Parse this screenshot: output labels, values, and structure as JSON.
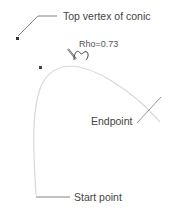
{
  "diagram": {
    "labels": {
      "top_vertex": "Top vertex of conic",
      "rho": "Rho=0.73",
      "endpoint": "Endpoint",
      "start_point": "Start point"
    },
    "colors": {
      "curve": "#d8d8d8",
      "leader": "#777777",
      "text": "#444444",
      "point": "#333333"
    }
  }
}
